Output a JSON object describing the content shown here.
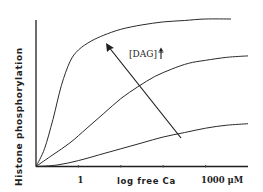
{
  "chart_data": {
    "type": "line",
    "title": "",
    "xlabel": "log free Ca",
    "ylabel": "Histone phosphorylation",
    "x_scale": "log",
    "xlim_log10": [
      -1,
      4
    ],
    "ylim": [
      0,
      1
    ],
    "x_tick_labels": [
      {
        "log10": 0,
        "label": "1"
      },
      {
        "log10": 3,
        "label": "1000 μM"
      }
    ],
    "x_ticks_log10": [
      0,
      1,
      2,
      3
    ],
    "grid": false,
    "series": [
      {
        "name": "high [DAG]",
        "x_log10": [
          -1,
          -0.8,
          -0.6,
          -0.4,
          -0.2,
          0,
          0.3,
          0.6,
          1,
          1.5,
          2,
          2.5,
          3,
          3.6
        ],
        "y": [
          0,
          0.12,
          0.32,
          0.55,
          0.71,
          0.79,
          0.85,
          0.89,
          0.93,
          0.96,
          0.98,
          0.99,
          1.0,
          1.0
        ]
      },
      {
        "name": "medium [DAG]",
        "x_log10": [
          -1,
          -0.6,
          -0.2,
          0.2,
          0.6,
          1,
          1.4,
          1.8,
          2.2,
          2.6,
          3,
          3.5,
          4
        ],
        "y": [
          0,
          0.08,
          0.16,
          0.26,
          0.36,
          0.46,
          0.54,
          0.61,
          0.66,
          0.7,
          0.72,
          0.74,
          0.75
        ]
      },
      {
        "name": "low [DAG]",
        "x_log10": [
          -1,
          -0.5,
          0,
          0.5,
          1,
          1.5,
          2,
          2.5,
          3,
          3.5,
          4
        ],
        "y": [
          0,
          0.01,
          0.04,
          0.08,
          0.12,
          0.16,
          0.2,
          0.23,
          0.26,
          0.28,
          0.29
        ]
      }
    ],
    "annotations": [
      {
        "text": "[DAG] †",
        "type": "arrow",
        "direction": "up-left",
        "from_series": "low [DAG]",
        "to_series": "high [DAG]",
        "meaning": "increasing diacylglycerol concentration"
      }
    ]
  },
  "labels": {
    "ylabel": "Histone phosphorylation",
    "xlabel": "log free Ca",
    "tick_1": "1",
    "tick_1000": "1000 μM",
    "annotation": "[DAG]",
    "annotation_arrow": "†"
  }
}
